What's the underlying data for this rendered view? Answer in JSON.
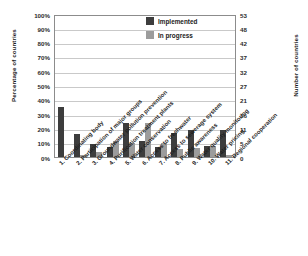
{
  "chart_data": {
    "type": "bar",
    "title": "",
    "xlabel": "",
    "ylabel": "Percentage of countries",
    "ylabel_secondary": "Number of countries",
    "ylim": [
      0,
      100
    ],
    "ylim_secondary": [
      0,
      53
    ],
    "grid": true,
    "legend_position": "top-right",
    "categories": [
      "1. Coordinating body",
      "2. Participation of major groups",
      "3. Groundwater pollution prevention",
      "4. Purification treatment plants",
      "5. Water conservation",
      "6. Access to freshwater",
      "7. Access to sewerage system",
      "8. Public awareness",
      "9. Water quality monitoring",
      "10. Water pricing",
      "11. Regional cooperation"
    ],
    "series": [
      {
        "name": "Implemented",
        "color": "#3d3d3d",
        "values": [
          35,
          16,
          9,
          7,
          24,
          11,
          7,
          17,
          19,
          7.5,
          19
        ]
      },
      {
        "name": "In progress",
        "color": "#9c9c9c",
        "values": [
          0,
          1.5,
          3.5,
          11,
          9.5,
          24,
          9.5,
          5.5,
          6,
          7.5,
          1.5
        ]
      }
    ],
    "yticks": [
      "0%",
      "10%",
      "20%",
      "30%",
      "40%",
      "50%",
      "60%",
      "70%",
      "80%",
      "90%",
      "100%"
    ],
    "yticks_secondary": [
      "0",
      "5",
      "11",
      "16",
      "21",
      "27",
      "32",
      "37",
      "42",
      "48",
      "53"
    ]
  }
}
